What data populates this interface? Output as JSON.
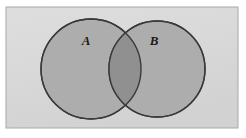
{
  "figure": {
    "type": "venn-diagram",
    "title": "",
    "universe_label": "",
    "background_color": "#ffffff"
  },
  "universe": {
    "name": "universal-set-rectangle",
    "fill_color": "#d9d9d9",
    "border_color": "#a8a8a8",
    "x": 6,
    "y": 7,
    "width": 232,
    "height": 121
  },
  "sets": [
    {
      "id": "A",
      "label": "A",
      "label_x": 86,
      "label_y": 45,
      "center_x": 91,
      "center_y": 69,
      "radius": 50,
      "fill_color": "#adadad",
      "stroke_color": "#3a3a3a"
    },
    {
      "id": "B",
      "label": "B",
      "label_x": 154,
      "label_y": 45,
      "center_x": 157,
      "center_y": 69,
      "radius": 48,
      "fill_color": "#adadad",
      "stroke_color": "#3a3a3a"
    }
  ],
  "intersection": {
    "name": "intersection-region",
    "label": "",
    "fill_color": "#909090"
  },
  "colors": {
    "page_background": "#ffffff",
    "universe_fill": "#d9d9d9",
    "universe_border": "#a8a8a8",
    "circle_fill": "#adadad",
    "circle_stroke": "#3a3a3a",
    "overlap_fill": "#909090",
    "label_text": "#1a1a1a"
  }
}
